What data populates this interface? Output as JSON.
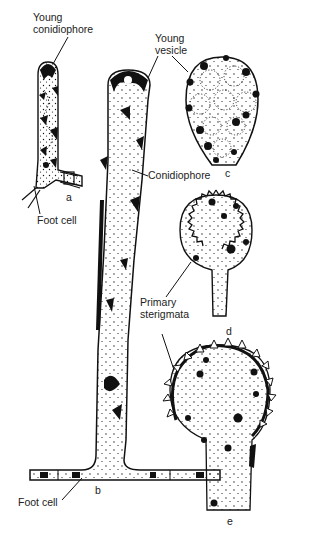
{
  "diagram": {
    "type": "biological-illustration",
    "labels": {
      "young_conidiophore": [
        "Young",
        "conidiophore"
      ],
      "young_vesicle": [
        "Young",
        "vesicle"
      ],
      "conidiophore": "Conidiophore",
      "foot_cell_a": "Foot cell",
      "foot_cell_b": "Foot cell",
      "primary_sterigmata": [
        "Primary",
        "sterigmata"
      ]
    },
    "panels": [
      {
        "id": "a",
        "letter": "a"
      },
      {
        "id": "b",
        "letter": "b"
      },
      {
        "id": "c",
        "letter": "c"
      },
      {
        "id": "d",
        "letter": "d"
      },
      {
        "id": "e",
        "letter": "e"
      }
    ],
    "colors": {
      "ink": "#111111",
      "paper": "#ffffff",
      "text": "#222222"
    }
  }
}
